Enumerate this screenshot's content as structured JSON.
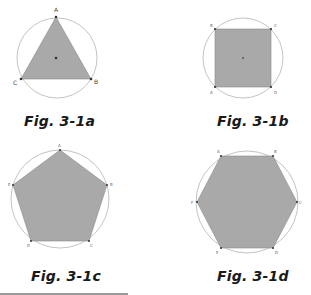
{
  "figures": [
    {
      "id": "a",
      "caption": "Fig. 3-1a",
      "shape": "equilateral triangle inscribed in circle",
      "vertices": [
        "A",
        "B",
        "C"
      ]
    },
    {
      "id": "b",
      "caption": "Fig. 3-1b",
      "shape": "square inscribed in circle",
      "vertices": [
        "A",
        "B",
        "C",
        "D"
      ]
    },
    {
      "id": "c",
      "caption": "Fig. 3-1c",
      "shape": "regular pentagon inscribed in circle",
      "vertices": [
        "A",
        "B",
        "C",
        "D",
        "E"
      ]
    },
    {
      "id": "d",
      "caption": "Fig. 3-1d",
      "shape": "regular hexagon inscribed in circle",
      "vertices": [
        "A",
        "B",
        "C",
        "D",
        "E",
        "F"
      ]
    }
  ],
  "colors": {
    "fill": "#a9a9a9",
    "circle": "#c4c4c4",
    "vertex": "#333333",
    "caption": "#1a1a1a"
  }
}
